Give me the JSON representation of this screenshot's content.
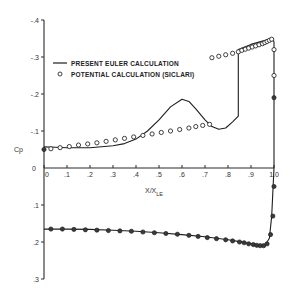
{
  "chart_data": {
    "type": "line",
    "title": "",
    "xlabel": "X/X_LE",
    "ylabel": "Cp",
    "xlim": [
      0,
      1.0
    ],
    "ylim": [
      0.3,
      -0.4
    ],
    "y_inverted": true,
    "grid": false,
    "legend_position": "upper-left",
    "x_ticks": [
      "0",
      ".1",
      ".2",
      ".3",
      ".4",
      ".5",
      ".6",
      ".7",
      ".8",
      ".9",
      "1.0"
    ],
    "y_ticks_top": [
      "-.4",
      "-.3",
      "-.2",
      "-.1"
    ],
    "y_ticks_bottom": [
      ".1",
      ".2",
      ".3"
    ],
    "y_zero_label": "0",
    "legend": [
      {
        "label": "PRESENT EULER CALCULATION",
        "marker": "line"
      },
      {
        "label": "POTENTIAL CALCULATION (SICLARI)",
        "marker": "open-circle"
      }
    ],
    "series": [
      {
        "name": "PRESENT EULER CALCULATION (upper surface)",
        "style": "line",
        "x": [
          0,
          0.05,
          0.1,
          0.2,
          0.3,
          0.35,
          0.4,
          0.45,
          0.5,
          0.55,
          0.6,
          0.63,
          0.66,
          0.7,
          0.73,
          0.76,
          0.79,
          0.82,
          0.845,
          0.845,
          0.9,
          0.95,
          0.98,
          0.995,
          1.0,
          1.0
        ],
        "y": [
          -0.057,
          -0.056,
          -0.055,
          -0.055,
          -0.06,
          -0.066,
          -0.078,
          -0.1,
          -0.13,
          -0.165,
          -0.186,
          -0.18,
          -0.16,
          -0.13,
          -0.112,
          -0.105,
          -0.108,
          -0.125,
          -0.14,
          -0.32,
          -0.334,
          -0.343,
          -0.348,
          -0.35,
          -0.34,
          0
        ]
      },
      {
        "name": "PRESENT EULER CALCULATION (lower surface)",
        "style": "line",
        "x": [
          0,
          0.1,
          0.2,
          0.3,
          0.4,
          0.5,
          0.6,
          0.7,
          0.8,
          0.85,
          0.9,
          0.93,
          0.95,
          0.965,
          0.98,
          0.99,
          1.0
        ],
        "y": [
          0.165,
          0.165,
          0.166,
          0.168,
          0.171,
          0.175,
          0.18,
          0.186,
          0.194,
          0.199,
          0.205,
          0.209,
          0.21,
          0.205,
          0.19,
          0.13,
          0
        ]
      },
      {
        "name": "POTENTIAL CALCULATION (SICLARI) (upper surface)",
        "style": "open-circle",
        "x": [
          0.03,
          0.07,
          0.11,
          0.15,
          0.19,
          0.23,
          0.27,
          0.31,
          0.35,
          0.39,
          0.43,
          0.47,
          0.51,
          0.55,
          0.59,
          0.63,
          0.66,
          0.69,
          0.72,
          0.73,
          0.76,
          0.79,
          0.82,
          0.845,
          0.86,
          0.875,
          0.89,
          0.905,
          0.92,
          0.935,
          0.95,
          0.96,
          0.97,
          0.98,
          0.99,
          1.0,
          1.0
        ],
        "y": [
          -0.052,
          -0.055,
          -0.058,
          -0.062,
          -0.065,
          -0.068,
          -0.072,
          -0.076,
          -0.08,
          -0.084,
          -0.088,
          -0.092,
          -0.096,
          -0.1,
          -0.104,
          -0.108,
          -0.112,
          -0.115,
          -0.118,
          -0.298,
          -0.302,
          -0.306,
          -0.31,
          -0.314,
          -0.318,
          -0.321,
          -0.324,
          -0.327,
          -0.33,
          -0.333,
          -0.336,
          -0.339,
          -0.342,
          -0.345,
          -0.348,
          -0.32,
          -0.25
        ]
      },
      {
        "name": "Euler solid points (lower surface)",
        "style": "filled-circle",
        "x": [
          0,
          0.03,
          0.08,
          0.13,
          0.18,
          0.23,
          0.28,
          0.33,
          0.38,
          0.43,
          0.48,
          0.53,
          0.58,
          0.63,
          0.67,
          0.71,
          0.75,
          0.79,
          0.82,
          0.85,
          0.87,
          0.89,
          0.91,
          0.925,
          0.94,
          0.955,
          0.97,
          0.985,
          0.995,
          1.0,
          1.0
        ],
        "y": [
          -0.05,
          0.165,
          0.165,
          0.166,
          0.167,
          0.168,
          0.169,
          0.17,
          0.171,
          0.173,
          0.175,
          0.177,
          0.179,
          0.182,
          0.185,
          0.188,
          0.191,
          0.194,
          0.197,
          0.2,
          0.202,
          0.205,
          0.207,
          0.209,
          0.21,
          0.21,
          0.205,
          0.18,
          0.13,
          0.05,
          -0.19
        ]
      }
    ]
  },
  "labels": {
    "cp": "Cp",
    "x_axis": "X/X",
    "x_axis_sub": "LE"
  }
}
